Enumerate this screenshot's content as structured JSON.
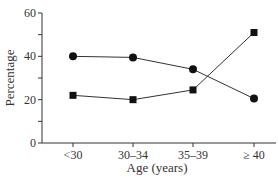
{
  "chart_data": {
    "type": "line",
    "title": "",
    "xlabel": "Age (years)",
    "ylabel": "Percentage",
    "categories": [
      "<30",
      "30–34",
      "35–39",
      "≥ 40"
    ],
    "ylim": [
      0,
      60
    ],
    "yticks": [
      0,
      20,
      40,
      60
    ],
    "grid": false,
    "legend": null,
    "series": [
      {
        "name": "circle-series",
        "marker": "circle",
        "values": [
          40,
          39.5,
          34,
          20.5
        ]
      },
      {
        "name": "square-series",
        "marker": "square",
        "values": [
          22,
          20,
          24.5,
          51
        ]
      }
    ]
  },
  "axes": {
    "x_label": "Age (years)",
    "y_label": "Percentage",
    "x_ticks": [
      "<30",
      "30–34",
      "35–39",
      "≥ 40"
    ],
    "y_ticks": [
      "0",
      "20",
      "40",
      "60"
    ]
  }
}
